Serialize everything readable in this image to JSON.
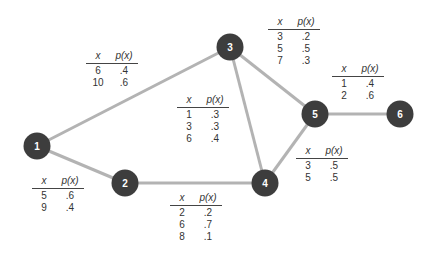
{
  "diagram": {
    "type": "network",
    "edge_color": "#b3b3b3",
    "node_color": "#3d3d3d",
    "nodes": [
      {
        "id": "1",
        "label": "1",
        "x": 37,
        "y": 146
      },
      {
        "id": "2",
        "label": "2",
        "x": 125,
        "y": 183
      },
      {
        "id": "3",
        "label": "3",
        "x": 230,
        "y": 47
      },
      {
        "id": "4",
        "label": "4",
        "x": 265,
        "y": 183
      },
      {
        "id": "5",
        "label": "5",
        "x": 315,
        "y": 114
      },
      {
        "id": "6",
        "label": "6",
        "x": 400,
        "y": 114
      }
    ],
    "edges": [
      {
        "from": "1",
        "to": "3"
      },
      {
        "from": "1",
        "to": "2"
      },
      {
        "from": "2",
        "to": "4"
      },
      {
        "from": "3",
        "to": "4"
      },
      {
        "from": "3",
        "to": "5"
      },
      {
        "from": "4",
        "to": "5"
      },
      {
        "from": "5",
        "to": "6"
      }
    ],
    "header": {
      "x": "x",
      "p": "p(x)"
    },
    "tables": [
      {
        "edge": "1-3",
        "rows": [
          {
            "x": "6",
            "p": ".4"
          },
          {
            "x": "10",
            "p": ".6"
          }
        ]
      },
      {
        "edge": "1-2",
        "rows": [
          {
            "x": "5",
            "p": ".6"
          },
          {
            "x": "9",
            "p": ".4"
          }
        ]
      },
      {
        "edge": "3-4",
        "rows": [
          {
            "x": "1",
            "p": ".3"
          },
          {
            "x": "3",
            "p": ".3"
          },
          {
            "x": "6",
            "p": ".4"
          }
        ]
      },
      {
        "edge": "2-4",
        "rows": [
          {
            "x": "2",
            "p": ".2"
          },
          {
            "x": "6",
            "p": ".7"
          },
          {
            "x": "8",
            "p": ".1"
          }
        ]
      },
      {
        "edge": "3-5",
        "rows": [
          {
            "x": "3",
            "p": ".2"
          },
          {
            "x": "5",
            "p": ".5"
          },
          {
            "x": "7",
            "p": ".3"
          }
        ]
      },
      {
        "edge": "5-6",
        "rows": [
          {
            "x": "1",
            "p": ".4"
          },
          {
            "x": "2",
            "p": ".6"
          }
        ]
      },
      {
        "edge": "4-5",
        "rows": [
          {
            "x": "3",
            "p": ".5"
          },
          {
            "x": "5",
            "p": ".5"
          }
        ]
      }
    ]
  }
}
